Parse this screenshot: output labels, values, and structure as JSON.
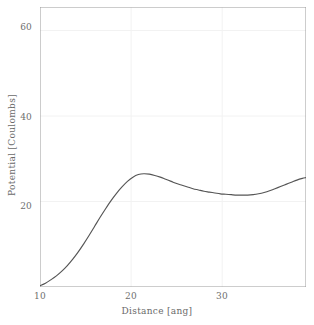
{
  "chart_data": {
    "type": "line",
    "title": "",
    "xlabel": "Distance [ang]",
    "ylabel": "Potential [Coulombs]",
    "xlim": [
      10,
      39.2
    ],
    "ylim": [
      0,
      65.5
    ],
    "grid": true,
    "legend": null,
    "line_color": "#555555",
    "axis_color": "#9a9a9a",
    "grid_color": "#f2f2f2",
    "background": "#ffffff",
    "x_major_ticks": [
      10,
      20,
      30
    ],
    "x_major_tick_labels": [
      "10",
      "20",
      "30"
    ],
    "x_minor_ticks": [
      15,
      25,
      35
    ],
    "y_major_ticks": [
      20,
      40,
      60
    ],
    "y_major_tick_labels": [
      "20",
      "40",
      "60"
    ],
    "y_minor_ticks": [
      10,
      30,
      50
    ],
    "series": [
      {
        "name": "potential",
        "x": [
          10.0,
          10.6,
          11.2,
          11.8,
          12.4,
          13.0,
          13.6,
          14.2,
          14.8,
          15.4,
          16.0,
          16.6,
          17.2,
          17.8,
          18.4,
          19.0,
          19.6,
          20.2,
          20.8,
          21.4,
          22.0,
          22.6,
          23.2,
          23.8,
          24.4,
          25.0,
          25.6,
          26.2,
          26.8,
          27.4,
          28.0,
          28.6,
          29.2,
          29.8,
          30.4,
          31.0,
          31.6,
          32.2,
          32.8,
          33.4,
          34.0,
          34.6,
          35.2,
          35.8,
          36.4,
          37.0,
          37.6,
          38.2,
          38.8,
          39.2
        ],
        "y": [
          0.3,
          0.9,
          1.7,
          2.6,
          3.7,
          5.0,
          6.5,
          8.2,
          10.1,
          12.1,
          14.2,
          16.3,
          18.3,
          20.2,
          21.9,
          23.4,
          24.7,
          25.7,
          26.3,
          26.5,
          26.4,
          26.1,
          25.7,
          25.2,
          24.7,
          24.2,
          23.8,
          23.4,
          23.0,
          22.7,
          22.4,
          22.2,
          22.0,
          21.8,
          21.7,
          21.6,
          21.5,
          21.5,
          21.5,
          21.6,
          21.8,
          22.1,
          22.5,
          23.0,
          23.5,
          24.0,
          24.5,
          25.0,
          25.4,
          25.6
        ]
      }
    ],
    "annotations": []
  },
  "axes": {
    "y_labels": [
      {
        "value": "60",
        "top": 22
      },
      {
        "value": "40",
        "top": 112
      },
      {
        "value": "20",
        "top": 201
      }
    ],
    "x_labels": [
      {
        "value": "10",
        "left": 26
      },
      {
        "value": "20",
        "left": 117
      },
      {
        "value": "30",
        "left": 208
      }
    ]
  }
}
